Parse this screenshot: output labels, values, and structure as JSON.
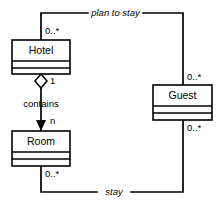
{
  "diagram": {
    "kind": "uml-class-diagram",
    "background_color": "#ffffff",
    "line_color": "#000000",
    "classes": [
      {
        "id": "hotel",
        "name": "Hotel"
      },
      {
        "id": "room",
        "name": "Room"
      },
      {
        "id": "guest",
        "name": "Guest"
      }
    ],
    "relationships": [
      {
        "id": "plan-to-stay",
        "label": "plan to stay",
        "from": "hotel",
        "to": "guest",
        "type": "association",
        "from_multiplicity": "0..*",
        "to_multiplicity": "0..*"
      },
      {
        "id": "contains",
        "label": "contains",
        "from": "hotel",
        "to": "room",
        "type": "aggregation",
        "from_multiplicity": "1",
        "to_multiplicity": "n"
      },
      {
        "id": "stay",
        "label": "stay",
        "from": "room",
        "to": "guest",
        "type": "association",
        "from_multiplicity": "0..*",
        "to_multiplicity": "0..*"
      }
    ],
    "labels": {
      "hotel_name": "Hotel",
      "room_name": "Room",
      "guest_name": "Guest",
      "plan_to_stay": "plan to stay",
      "stay": "stay",
      "contains": "contains",
      "mult_hotel_top": "0..*",
      "mult_hotel_bottom": "1",
      "mult_room_top": "n",
      "mult_room_bottom": "0..*",
      "mult_guest_top": "0..*",
      "mult_guest_bottom": "0..*"
    }
  }
}
